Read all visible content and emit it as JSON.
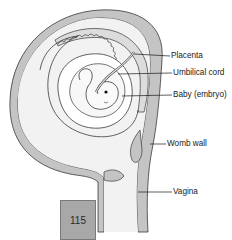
{
  "diagram": {
    "labels": [
      {
        "id": "placenta",
        "text": "Placenta"
      },
      {
        "id": "umbilical_cord",
        "text": "Umbilical cord"
      },
      {
        "id": "baby",
        "text": "Baby (embryo)"
      },
      {
        "id": "womb_wall",
        "text": "Womb wall"
      },
      {
        "id": "vagina",
        "text": "Vagina"
      }
    ],
    "page_number": "115",
    "colors": {
      "womb_wall": "#c4c4c4",
      "outline": "#3a3a3a",
      "fluid": "#f0f0f0",
      "page_box": "#a8a8a8"
    }
  }
}
